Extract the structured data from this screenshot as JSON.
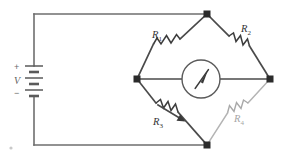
{
  "figure": {
    "background_color": "#ffffff",
    "width": 285,
    "height": 159
  },
  "source": {
    "name": "battery",
    "symbol": "multi-cell-battery",
    "voltage_label": "V",
    "positive_sign": "+",
    "negative_sign": "−"
  },
  "meter": {
    "name": "galvanometer",
    "symbol": "analog-meter-with-needle",
    "label": ""
  },
  "components": [
    {
      "id": "R1",
      "label": "R",
      "subscript": "1",
      "type": "fixed-resistor",
      "branch": "upper-left",
      "color": "#3c3c3c"
    },
    {
      "id": "R2",
      "label": "R",
      "subscript": "2",
      "type": "fixed-resistor",
      "branch": "upper-right",
      "color": "#3c3c3c"
    },
    {
      "id": "R3",
      "label": "R",
      "subscript": "3",
      "type": "variable-resistor",
      "branch": "lower-left",
      "color": "#3c3c3c"
    },
    {
      "id": "R4",
      "label": "R",
      "subscript": "4",
      "type": "fixed-resistor",
      "branch": "lower-right",
      "color": "#a8a8a8"
    }
  ],
  "nodes": [
    {
      "id": "top",
      "name": "bridge-node-top"
    },
    {
      "id": "left",
      "name": "bridge-node-left"
    },
    {
      "id": "right",
      "name": "bridge-node-right"
    },
    {
      "id": "bottom",
      "name": "bridge-node-bottom"
    }
  ]
}
